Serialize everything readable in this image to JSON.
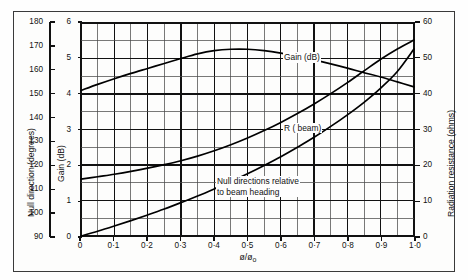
{
  "chart_data": {
    "type": "line",
    "title": "",
    "xlabel": "ø/ø₀",
    "xlim": [
      0,
      1.0
    ],
    "xticks": [
      0,
      0.1,
      0.2,
      0.3,
      0.4,
      0.5,
      0.6,
      0.7,
      0.8,
      0.9,
      1.0
    ],
    "xticklabels": [
      "0",
      "0·1",
      "0·2",
      "0·3",
      "0·4",
      "0·5",
      "0·6",
      "0·7",
      "0·8",
      "0·9",
      "1·0"
    ],
    "grid": true,
    "grid_minor_x_step": 0.05,
    "grid_minor_y_step": 0.5,
    "axes": [
      {
        "id": "gain",
        "position": "left-inner",
        "label": "Gain (dB)",
        "lim": [
          0,
          6
        ],
        "ticks": [
          0,
          1,
          2,
          3,
          4,
          5,
          6
        ],
        "ticklabels": [
          "0",
          "1",
          "2",
          "3",
          "4",
          "5",
          "6"
        ]
      },
      {
        "id": "null-direction",
        "position": "left-outer",
        "label": "Null direction (degrees)",
        "lim": [
          90,
          180
        ],
        "ticks": [
          90,
          100,
          110,
          120,
          130,
          140,
          150,
          160,
          170,
          180
        ],
        "ticklabels": [
          "90",
          "100",
          "110",
          "120",
          "130",
          "140",
          "150",
          "160",
          "170",
          "180"
        ]
      },
      {
        "id": "radiation-resistance",
        "position": "right",
        "label": "Radiation resistance (ohms)",
        "lim": [
          0,
          60
        ],
        "ticks": [
          0,
          10,
          20,
          30,
          40,
          50,
          60
        ],
        "ticklabels": [
          "0",
          "10",
          "20",
          "30",
          "40",
          "50",
          "60"
        ]
      }
    ],
    "series": [
      {
        "name": "Gain (dB)",
        "axis": "gain",
        "annotation": "Gain (dB)",
        "x": [
          0,
          0.05,
          0.1,
          0.15,
          0.2,
          0.25,
          0.3,
          0.35,
          0.4,
          0.45,
          0.5,
          0.55,
          0.6,
          0.65,
          0.7,
          0.75,
          0.8,
          0.85,
          0.9,
          0.95,
          1.0
        ],
        "y": [
          4.1,
          4.27,
          4.43,
          4.58,
          4.72,
          4.86,
          5.0,
          5.13,
          5.22,
          5.26,
          5.26,
          5.22,
          5.15,
          5.06,
          4.96,
          4.85,
          4.73,
          4.6,
          4.48,
          4.34,
          4.2
        ]
      },
      {
        "name": "R (beam)",
        "axis": "radiation-resistance",
        "annotation": "R ( beam)",
        "x": [
          0,
          0.05,
          0.1,
          0.15,
          0.2,
          0.25,
          0.3,
          0.35,
          0.4,
          0.45,
          0.5,
          0.55,
          0.6,
          0.65,
          0.7,
          0.75,
          0.8,
          0.85,
          0.9,
          0.95,
          1.0
        ],
        "y": [
          16.0,
          16.7,
          17.4,
          18.2,
          19.1,
          20.1,
          21.2,
          22.5,
          24.0,
          25.7,
          27.6,
          29.7,
          32.0,
          34.5,
          37.2,
          40.1,
          43.2,
          46.5,
          49.8,
          52.7,
          55.2
        ]
      },
      {
        "name": "Null directions relative to beam heading",
        "axis": "null-direction",
        "annotation_line1": "Null directions relative",
        "annotation_line2": "to beam heading",
        "x": [
          0,
          0.05,
          0.1,
          0.15,
          0.2,
          0.25,
          0.3,
          0.35,
          0.4,
          0.45,
          0.5,
          0.55,
          0.6,
          0.65,
          0.7,
          0.75,
          0.8,
          0.85,
          0.9,
          0.95,
          1.0
        ],
        "y": [
          90.0,
          92.0,
          94.2,
          96.5,
          98.9,
          101.4,
          104.1,
          106.9,
          109.9,
          113.0,
          116.3,
          119.8,
          123.5,
          127.5,
          131.7,
          136.3,
          141.2,
          146.5,
          152.5,
          159.5,
          169.0
        ]
      }
    ]
  },
  "annotations": {
    "gain": "Gain (dB)",
    "r_beam": "R ( beam)",
    "null_l1": "Null directions relative",
    "null_l2": "to beam heading"
  },
  "titles": {
    "left_outer": "Null direction (degrees)",
    "left_inner": "Gain (dB)",
    "right": "Radiation resistance (ohms)",
    "x": "ø/ø₀"
  }
}
